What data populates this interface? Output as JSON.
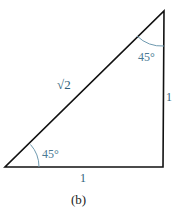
{
  "diagram": {
    "caption": "(b)",
    "hypotenuse_label": "√2",
    "side_vertical_label": "1",
    "side_bottom_label": "1",
    "angle_top_label": "45°",
    "angle_bottom_label": "45°",
    "colors": {
      "stroke": "#111111",
      "angle_label": "#4a7a94",
      "side_label": "#2f5f7a",
      "arc": "#6f9ab0"
    }
  }
}
